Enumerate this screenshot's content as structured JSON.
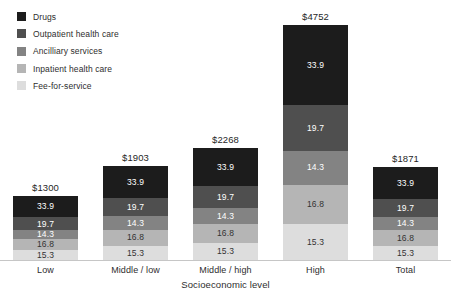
{
  "chart_data": {
    "type": "bar",
    "variant": "stacked",
    "xlabel": "Socioeconomic level",
    "legend_position": "top-left",
    "grid": false,
    "axis_line_color": "#c6c6c6",
    "categories": [
      "Low",
      "Middle / low",
      "Middle / high",
      "High",
      "Total"
    ],
    "totals": [
      1300,
      1903,
      2268,
      4752,
      1871
    ],
    "total_labels": [
      "$1300",
      "$1903",
      "$2268",
      "$4752",
      "$1871"
    ],
    "series": [
      {
        "name": "Drugs",
        "percent": 33.9,
        "label": "33.9",
        "color": "#1c1c1c",
        "label_color": "#ffffff"
      },
      {
        "name": "Outpatient health care",
        "percent": 19.7,
        "label": "19.7",
        "color": "#4f4f4f",
        "label_color": "#ffffff"
      },
      {
        "name": "Ancilliary services",
        "percent": 14.3,
        "label": "14.3",
        "color": "#838383",
        "label_color": "#ffffff"
      },
      {
        "name": "Inpatient health care",
        "percent": 16.8,
        "label": "16.8",
        "color": "#b5b5b5",
        "label_color": "#333333"
      },
      {
        "name": "Fee-for-service",
        "percent": 15.3,
        "label": "15.3",
        "color": "#dddddd",
        "label_color": "#333333"
      }
    ]
  }
}
